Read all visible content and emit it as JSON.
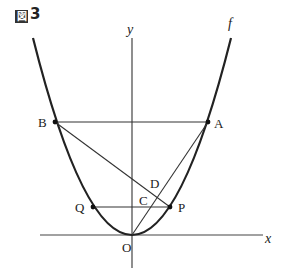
{
  "figure": {
    "title_mark": "図",
    "title_number": "3"
  },
  "axes": {
    "x_label": "x",
    "y_label": "y",
    "origin_label": "O"
  },
  "curve": {
    "label": "f",
    "type": "parabola y = ax^2"
  },
  "points": {
    "A": "A",
    "B": "B",
    "C": "C",
    "D": "D",
    "P": "P",
    "Q": "Q"
  }
}
